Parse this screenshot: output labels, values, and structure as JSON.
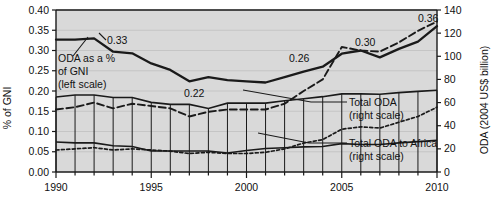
{
  "chart_data": {
    "type": "line",
    "title": "",
    "xlabel": "",
    "ylabel": "% of GNI",
    "y2label": "ODA (2004 US$ billion)",
    "xlim": [
      1990,
      2010
    ],
    "ylim": [
      0.0,
      0.4
    ],
    "y2lim": [
      0,
      140
    ],
    "grid": true,
    "legend_position": "inline-annotations",
    "x": [
      1990,
      1991,
      1992,
      1993,
      1994,
      1995,
      1996,
      1997,
      1998,
      1999,
      2000,
      2001,
      2002,
      2003,
      2004,
      2005,
      2006,
      2007,
      2008,
      2009,
      2010
    ],
    "xticks": [
      1990,
      1991,
      1992,
      1993,
      1994,
      1995,
      1996,
      1997,
      1998,
      1999,
      2000,
      2001,
      2002,
      2003,
      2004,
      2005,
      2006,
      2007,
      2008,
      2009,
      2010
    ],
    "xticklabels": [
      "1990",
      "",
      "",
      "",
      "",
      "1995",
      "",
      "",
      "",
      "",
      "2000",
      "",
      "",
      "",
      "",
      "2005",
      "",
      "",
      "",
      "",
      "2010"
    ],
    "yticks": [
      0.0,
      0.05,
      0.1,
      0.15,
      0.2,
      0.25,
      0.3,
      0.35,
      0.4
    ],
    "yticklabels": [
      "0.00",
      "0.05",
      "0.10",
      "0.15",
      "0.20",
      "0.25",
      "0.30",
      "0.35",
      "0.40"
    ],
    "y2ticks": [
      0,
      20,
      40,
      60,
      80,
      100,
      120,
      140
    ],
    "y2ticklabels": [
      "0",
      "20",
      "40",
      "60",
      "80",
      "100",
      "120",
      "140"
    ],
    "series": [
      {
        "name": "ODA as a % of GNI (left scale)",
        "axis": "left",
        "style": "solid-thick",
        "values": [
          0.327,
          0.327,
          0.33,
          0.297,
          0.293,
          0.268,
          0.252,
          0.224,
          0.234,
          0.227,
          0.224,
          0.221,
          0.234,
          0.248,
          0.26,
          0.292,
          0.3,
          0.283,
          0.304,
          0.322,
          0.36
        ]
      },
      {
        "name": "Total ODA (right scale)",
        "axis": "right",
        "style": "dashed",
        "values": [
          54,
          56,
          60,
          55,
          59,
          57,
          55,
          48,
          52,
          54,
          54,
          54,
          59,
          70,
          80,
          108,
          105,
          104,
          112,
          122,
          130
        ]
      },
      {
        "name": "Total ODA to Africa (right scale)",
        "axis": "right",
        "style": "dotted",
        "values": [
          19,
          20,
          21,
          19,
          20,
          19,
          18,
          16,
          17,
          16,
          16,
          17,
          20,
          25,
          28,
          37,
          39,
          38,
          43,
          48,
          56
        ]
      },
      {
        "name": "Total ODA bars (left scale overlay)",
        "axis": "left",
        "style": "solid-thin-bars",
        "values": [
          0.185,
          0.19,
          0.19,
          0.184,
          0.184,
          0.172,
          0.167,
          0.167,
          0.157,
          0.17,
          0.17,
          0.17,
          0.176,
          0.181,
          0.186,
          0.193,
          0.193,
          0.192,
          0.196,
          0.199,
          0.202
        ]
      },
      {
        "name": "Total ODA to Africa bars (left scale overlay)",
        "axis": "left",
        "style": "solid-thin-bars-low",
        "values": [
          0.074,
          0.072,
          0.072,
          0.065,
          0.063,
          0.052,
          0.052,
          0.052,
          0.052,
          0.047,
          0.053,
          0.058,
          0.06,
          0.062,
          0.063,
          0.07,
          0.068,
          0.068,
          0.072,
          0.075,
          0.078
        ]
      }
    ],
    "point_labels": [
      {
        "text": "0.33",
        "x": 1992,
        "value": 0.33,
        "series": "ODA as a % of GNI (left scale)"
      },
      {
        "text": "0.22",
        "x": 1997,
        "value": 0.22,
        "series": "ODA as a % of GNI (left scale)"
      },
      {
        "text": "0.26",
        "x": 2004,
        "value": 0.26,
        "series": "ODA as a % of GNI (left scale)"
      },
      {
        "text": "0.30",
        "x": 2006,
        "value": 0.3,
        "series": "ODA as a % of GNI (left scale)"
      },
      {
        "text": "0.36",
        "x": 2010,
        "value": 0.36,
        "series": "ODA as a % of GNI (left scale)"
      }
    ],
    "annotations": [
      {
        "id": "oda-gni",
        "line1": "ODA as a %",
        "line2": "of GNI",
        "line3": "(left scale)"
      },
      {
        "id": "total-oda",
        "line1": "Total ODA",
        "line2": "(right scale)"
      },
      {
        "id": "total-oda-africa",
        "line1": "Total ODA to Africa",
        "line2": "(right scale)"
      }
    ],
    "colors": {
      "plot_background": "#d9d9d9",
      "line": "#1a1a1a",
      "grid": "#c0c0c0",
      "axis": "#1a1a1a",
      "text": "#111111",
      "page_background": "#ffffff"
    }
  }
}
